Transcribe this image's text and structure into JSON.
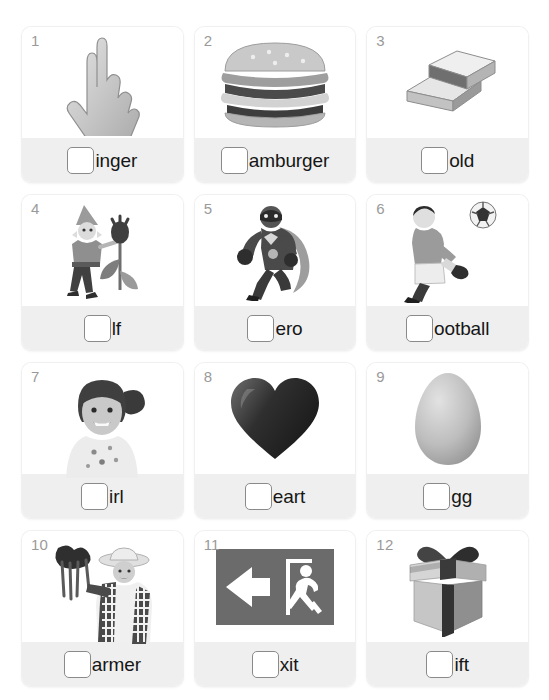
{
  "worksheet": {
    "type": "initial-sound-phonics-worksheet",
    "columns": 3,
    "rows": 4,
    "background_color": "#ffffff",
    "card_footer_color": "#efefef",
    "number_color": "#9a9a9a",
    "text_color": "#161616",
    "checkbox_border_color": "#8a8a8a"
  },
  "cards": [
    {
      "number": "1",
      "word_tail": "inger",
      "missing_letter": "f",
      "full_word": "finger",
      "image": "pointing-hand-photo"
    },
    {
      "number": "2",
      "word_tail": "amburger",
      "missing_letter": "h",
      "full_word": "hamburger",
      "image": "hamburger-photo"
    },
    {
      "number": "3",
      "word_tail": "old",
      "missing_letter": "g",
      "full_word": "gold",
      "image": "gold-bars-photo"
    },
    {
      "number": "4",
      "word_tail": "lf",
      "missing_letter": "e",
      "full_word": "elf",
      "image": "elf-with-tulip-illustration"
    },
    {
      "number": "5",
      "word_tail": "ero",
      "missing_letter": "h",
      "full_word": "hero",
      "image": "superhero-illustration"
    },
    {
      "number": "6",
      "word_tail": "ootball",
      "missing_letter": "f",
      "full_word": "football",
      "image": "boy-kicking-football-photo"
    },
    {
      "number": "7",
      "word_tail": "irl",
      "missing_letter": "g",
      "full_word": "girl",
      "image": "smiling-girl-photo"
    },
    {
      "number": "8",
      "word_tail": "eart",
      "missing_letter": "h",
      "full_word": "heart",
      "image": "heart-photo"
    },
    {
      "number": "9",
      "word_tail": "gg",
      "missing_letter": "e",
      "full_word": "egg",
      "image": "egg-photo"
    },
    {
      "number": "10",
      "word_tail": "armer",
      "missing_letter": "f",
      "full_word": "farmer",
      "image": "farmer-with-carrots-photo"
    },
    {
      "number": "11",
      "word_tail": "xit",
      "missing_letter": "e",
      "full_word": "exit",
      "image": "exit-sign-graphic"
    },
    {
      "number": "12",
      "word_tail": "ift",
      "missing_letter": "g",
      "full_word": "gift",
      "image": "gift-box-photo"
    }
  ]
}
